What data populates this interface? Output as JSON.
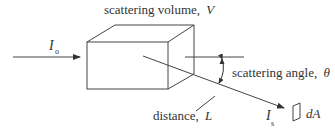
{
  "diagram": {
    "labels": {
      "volume": "scattering volume,",
      "volume_symbol": "V",
      "incident": "I",
      "incident_sub": "o",
      "angle": "scattering angle,",
      "angle_symbol": "θ",
      "distance": "distance,",
      "distance_symbol": "L",
      "scattered": "I",
      "scattered_sub": "s",
      "area": "dA"
    },
    "colors": {
      "stroke": "#444444",
      "text": "#333333",
      "background": "#ffffff"
    }
  }
}
